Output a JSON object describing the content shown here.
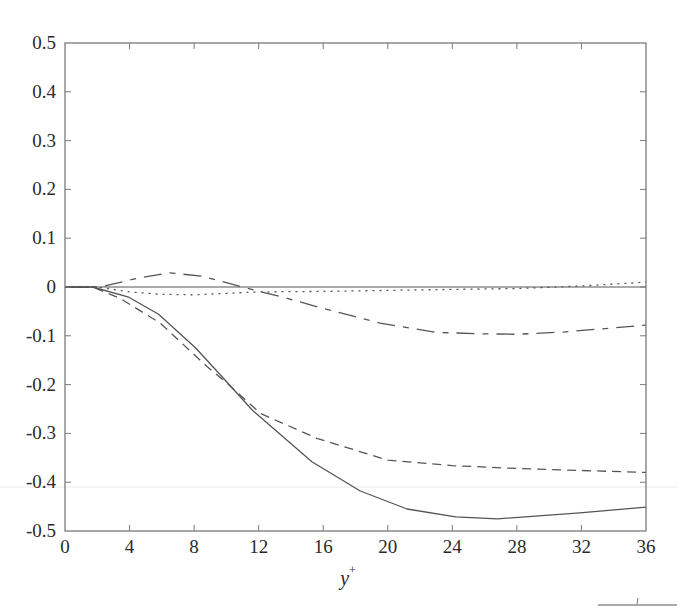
{
  "chart_data": {
    "type": "line",
    "title": "",
    "xlabel": "y+",
    "xlabel_main": "y",
    "xlabel_sup": "+",
    "ylabel": "",
    "xlim": [
      0,
      36
    ],
    "ylim": [
      -0.5,
      0.5
    ],
    "grid": false,
    "legend": null,
    "x_ticks": [
      0,
      4,
      8,
      12,
      16,
      20,
      24,
      28,
      32,
      36
    ],
    "x_tick_labels": [
      "0",
      "4",
      "8",
      "12",
      "16",
      "20",
      "24",
      "28",
      "32",
      "36"
    ],
    "y_ticks": [
      0.5,
      0.4,
      0.3,
      0.2,
      0.1,
      0,
      -0.1,
      -0.2,
      -0.3,
      -0.4,
      -0.5
    ],
    "y_tick_labels": [
      "0.5",
      "0.4",
      "0.3",
      "0.2",
      "0.1",
      "0",
      "-0.1",
      "-0.2",
      "-0.3",
      "-0.4",
      "-0.5"
    ],
    "reference_line": {
      "y": 0,
      "style": "solid"
    },
    "series": [
      {
        "name": "solid",
        "style": "solid",
        "x": [
          0,
          1.7,
          3.9,
          5.8,
          8.1,
          9.9,
          11.6,
          15.3,
          18.3,
          21.2,
          24.2,
          26.8,
          31.9,
          36
        ],
        "y": [
          0,
          0,
          -0.02,
          -0.056,
          -0.125,
          -0.19,
          -0.252,
          -0.358,
          -0.418,
          -0.455,
          -0.471,
          -0.475,
          -0.463,
          -0.451
        ]
      },
      {
        "name": "dashed",
        "style": "dashed",
        "x": [
          0,
          1.7,
          3.4,
          5.9,
          8.8,
          10.0,
          12.1,
          15.6,
          20.0,
          24.0,
          28.0,
          32.0,
          36
        ],
        "y": [
          0,
          0,
          -0.023,
          -0.074,
          -0.163,
          -0.196,
          -0.259,
          -0.31,
          -0.355,
          -0.366,
          -0.372,
          -0.376,
          -0.38
        ]
      },
      {
        "name": "dotted",
        "style": "dotted",
        "x": [
          0,
          2,
          4,
          6,
          8,
          10,
          12,
          16,
          20,
          24,
          28,
          32,
          36
        ],
        "y": [
          0,
          0,
          -0.01,
          -0.015,
          -0.016,
          -0.013,
          -0.01,
          -0.009,
          -0.007,
          -0.005,
          -0.003,
          0.002,
          0.01
        ]
      },
      {
        "name": "dash-dot",
        "style": "dashdot",
        "x": [
          0,
          2.2,
          4.5,
          6.5,
          8.5,
          11.0,
          12.4,
          13.5,
          16.0,
          19.5,
          23.0,
          25.9,
          28.0,
          31.0,
          36
        ],
        "y": [
          0,
          0,
          0.018,
          0.029,
          0.022,
          0.0,
          -0.012,
          -0.021,
          -0.044,
          -0.074,
          -0.093,
          -0.096,
          -0.097,
          -0.092,
          -0.078
        ]
      }
    ]
  },
  "plot_box": {
    "left": 65,
    "top": 43,
    "right": 646,
    "bottom": 531
  },
  "colors": {
    "axis": "#7a7a7a",
    "line": "#555555",
    "text": "#2a2a2a"
  }
}
